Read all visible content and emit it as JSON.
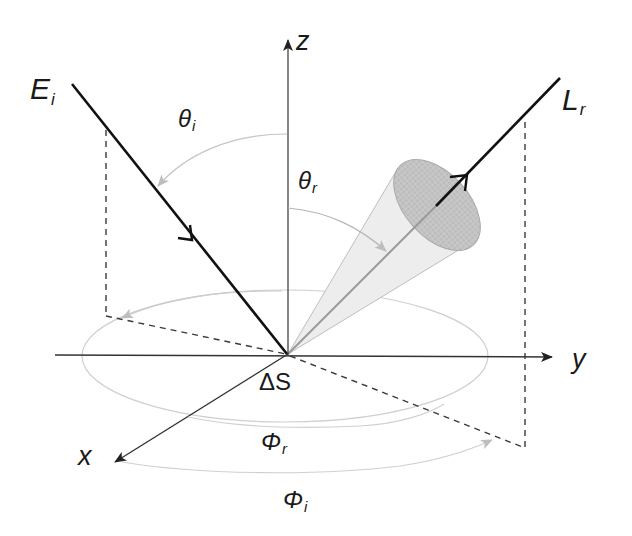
{
  "figure": {
    "colors": {
      "ray": "#1a1a1a",
      "axis": "#333333",
      "dashed": "#3a3a3a",
      "arc": "#c0c0c0",
      "cone_fill": "#e9e9e9",
      "cone_base": "#bdbdbd"
    },
    "axes": {
      "z": "z",
      "y": "y",
      "x": "x"
    },
    "labels": {
      "incident": {
        "main": "E",
        "sub": "i"
      },
      "reflected": {
        "main": "L",
        "sub": "r"
      },
      "theta_i": {
        "main": "θ",
        "sub": "i"
      },
      "theta_r": {
        "main": "θ",
        "sub": "r"
      },
      "phi_r": {
        "main": "Φ",
        "sub": "r"
      },
      "phi_i": {
        "main": "Φ",
        "sub": "i"
      },
      "surface": "ΔS"
    }
  }
}
